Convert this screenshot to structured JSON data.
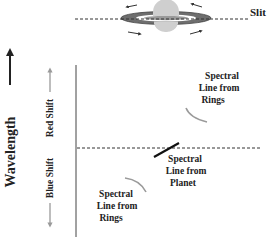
{
  "diagram": {
    "slit_label": "Slit",
    "axis_label": "Wavelength",
    "red_shift_label": "Red Shift",
    "blue_shift_label": "Blue Shift",
    "labels": {
      "rings_upper": [
        "Spectral",
        "Line from",
        "Rings"
      ],
      "planet": [
        "Spectral",
        "Line from",
        "Planet"
      ],
      "rings_lower": [
        "Spectral",
        "Line from",
        "Rings"
      ]
    },
    "colors": {
      "ink": "#222222",
      "gray_arrow": "#9a9a9a",
      "ring_dark": "#6e6e6e",
      "planet_fill": "#cfcfcf",
      "ring_curve": "#9a9a9a"
    }
  }
}
